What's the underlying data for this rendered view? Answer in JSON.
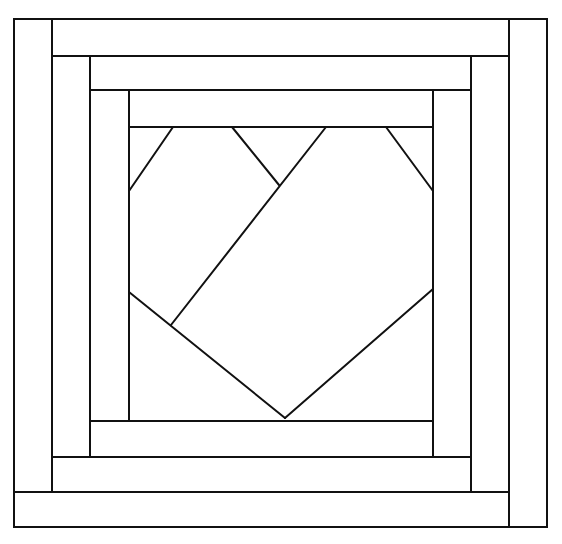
{
  "diagram": {
    "type": "quilt-block-line-drawing",
    "stroke_color": "#111111",
    "background_color": "#ffffff",
    "stroke_width": 2,
    "outer_frame": {
      "x1": 14,
      "y1": 19,
      "x2": 547,
      "y2": 527
    },
    "rings": [
      {
        "name": "outer-ring",
        "strips": [
          {
            "side": "left",
            "x1": 14,
            "y1": 19,
            "x2": 52,
            "y2": 492
          },
          {
            "side": "top",
            "x1": 52,
            "y1": 19,
            "x2": 509,
            "y2": 56
          },
          {
            "side": "right",
            "x1": 509,
            "y1": 19,
            "x2": 547,
            "y2": 527
          },
          {
            "side": "bottom",
            "x1": 14,
            "y1": 492,
            "x2": 509,
            "y2": 527
          }
        ]
      },
      {
        "name": "middle-ring",
        "strips": [
          {
            "side": "left",
            "x1": 52,
            "y1": 56,
            "x2": 90,
            "y2": 457
          },
          {
            "side": "top",
            "x1": 90,
            "y1": 56,
            "x2": 471,
            "y2": 90
          },
          {
            "side": "right",
            "x1": 471,
            "y1": 56,
            "x2": 509,
            "y2": 492
          },
          {
            "side": "bottom",
            "x1": 52,
            "y1": 457,
            "x2": 471,
            "y2": 492
          }
        ]
      },
      {
        "name": "inner-ring",
        "strips": [
          {
            "side": "left",
            "x1": 90,
            "y1": 90,
            "x2": 129,
            "y2": 421
          },
          {
            "side": "top",
            "x1": 129,
            "y1": 90,
            "x2": 433,
            "y2": 127
          },
          {
            "side": "right",
            "x1": 433,
            "y1": 90,
            "x2": 471,
            "y2": 457
          },
          {
            "side": "bottom",
            "x1": 90,
            "y1": 421,
            "x2": 433,
            "y2": 457
          }
        ]
      }
    ],
    "center_square": {
      "x1": 129,
      "y1": 127,
      "x2": 433,
      "y2": 421
    },
    "center_lines": [
      {
        "name": "top-left-corner-cut",
        "x1": 173,
        "y1": 127,
        "x2": 129,
        "y2": 191
      },
      {
        "name": "left-lobe-right-edge",
        "x1": 232,
        "y1": 127,
        "x2": 279,
        "y2": 185
      },
      {
        "name": "heart-center-diagonal",
        "x1": 326,
        "y1": 127,
        "x2": 171,
        "y2": 325
      },
      {
        "name": "top-right-corner-cut",
        "x1": 386,
        "y1": 127,
        "x2": 433,
        "y2": 191
      },
      {
        "name": "heart-bottom-left-edge",
        "x1": 129,
        "y1": 292,
        "x2": 285,
        "y2": 418
      },
      {
        "name": "heart-bottom-right-edge",
        "x1": 285,
        "y1": 418,
        "x2": 433,
        "y2": 289
      }
    ]
  }
}
